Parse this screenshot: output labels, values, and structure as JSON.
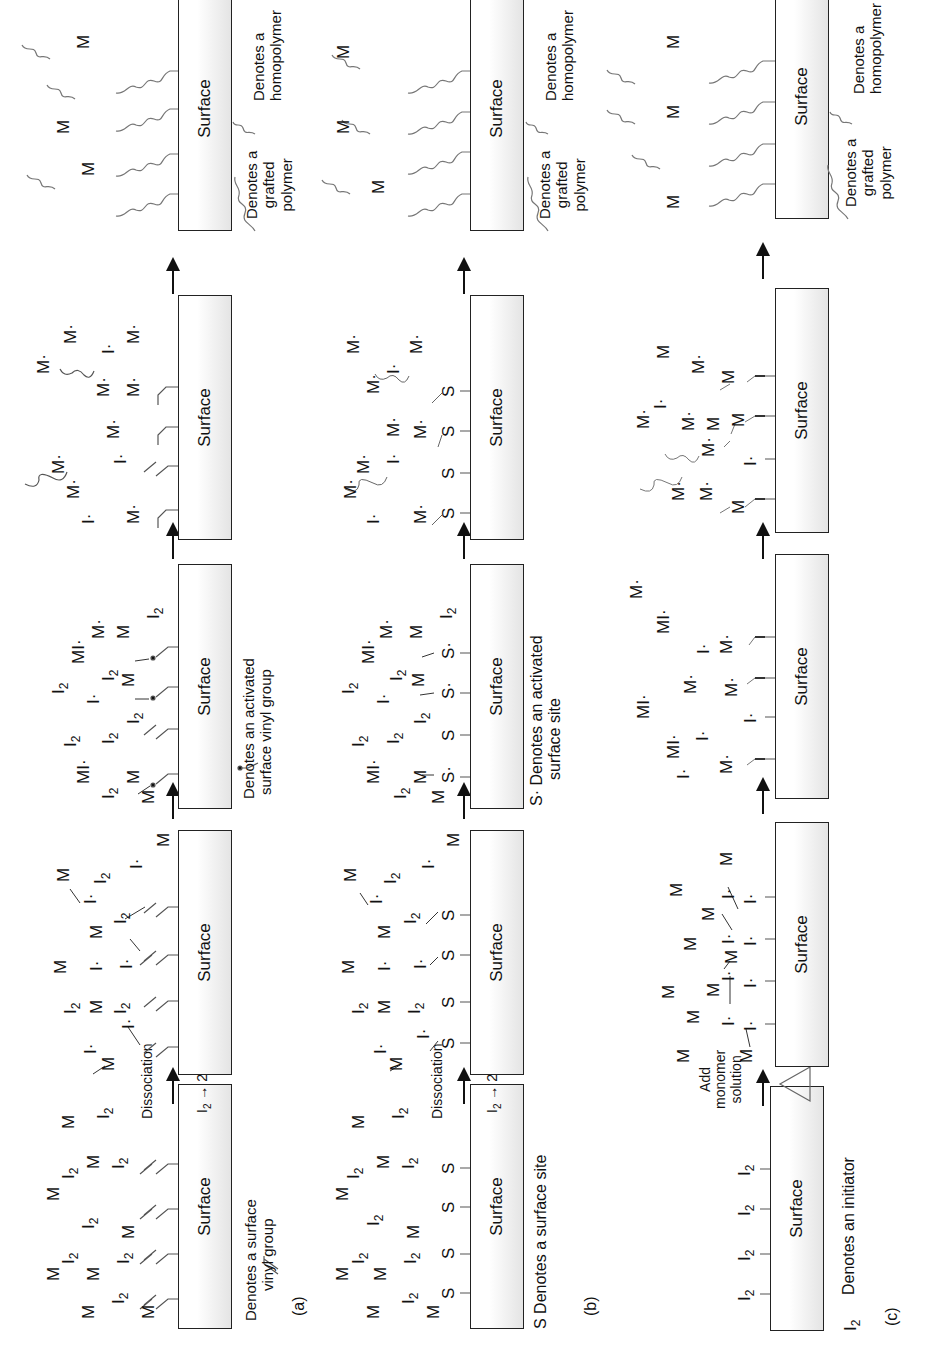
{
  "figure": {
    "orientation": "rotated-90-ccw",
    "panels": [
      {
        "id": "a",
        "caption": "(a)",
        "surface_label": "Surface",
        "legend_stage1": "Denotes a surface vinyl group",
        "legend_stage1_lines": [
          "Denotes a surface",
          "vinyl group"
        ],
        "arrow1_label": "Dissociation",
        "arrow1_reaction": "I2 → 2I·",
        "legend_stage3_lines": [
          "Denotes an activated",
          "surface vinyl group"
        ],
        "legend_grafted_lines": [
          "Denotes a",
          "grafted",
          "polymer"
        ],
        "legend_homopolymer_lines": [
          "Denotes a",
          "homopolymer"
        ],
        "site_symbol": "vinyl"
      },
      {
        "id": "b",
        "caption": "(b)",
        "surface_label": "Surface",
        "legend_stage1_lines": [
          "S Denotes a surface site"
        ],
        "arrow1_label": "Dissociation",
        "arrow1_reaction": "I2 → 2I·",
        "legend_stage3_lines": [
          "S· Denotes an activated",
          "surface site"
        ],
        "legend_grafted_lines": [
          "Denotes a",
          "grafted",
          "polymer"
        ],
        "legend_homopolymer_lines": [
          "Denotes a",
          "homopolymer"
        ],
        "site_symbol": "S"
      },
      {
        "id": "c",
        "caption": "(c)",
        "surface_label": "Surface",
        "legend_stage1_lines": [
          "I2  Denotes an initiator"
        ],
        "arrow1_label_lines": [
          "Add",
          "monomer",
          "solution"
        ],
        "arrow1_symbol": "△ (heat)",
        "legend_grafted_lines": [
          "Denotes a",
          "grafted",
          "polymer"
        ],
        "legend_homopolymer_lines": [
          "Denotes a",
          "homopolymer"
        ],
        "site_symbol": "I2"
      }
    ],
    "text": {
      "surface": "Surface",
      "M": "M",
      "I2": "I",
      "sub2": "2",
      "Idot": "I·",
      "Mdot": "M·",
      "MIdot": "MI·",
      "S": "S",
      "Sdot": "S·",
      "dissociation": "Dissociation",
      "two_I_dot": "2I·",
      "add": "Add",
      "monomer": "monomer",
      "solution": "solution",
      "cap_a": "(a)",
      "cap_b": "(b)",
      "cap_c": "(c)",
      "leg_a1_1": "Denotes a surface",
      "leg_a1_2": "vinyl group",
      "leg_a3_1": "Denotes an activated",
      "leg_a3_2": "surface vinyl group",
      "leg_b1": "S Denotes a surface site",
      "leg_b3_1": "S· Denotes an activated",
      "leg_b3_2": "surface site",
      "leg_c1": "Denotes an initiator",
      "leg_graft_1": "Denotes a",
      "leg_graft_2": "grafted",
      "leg_graft_3": "polymer",
      "leg_homo_1": "Denotes a",
      "leg_homo_2": "homopolymer"
    }
  }
}
